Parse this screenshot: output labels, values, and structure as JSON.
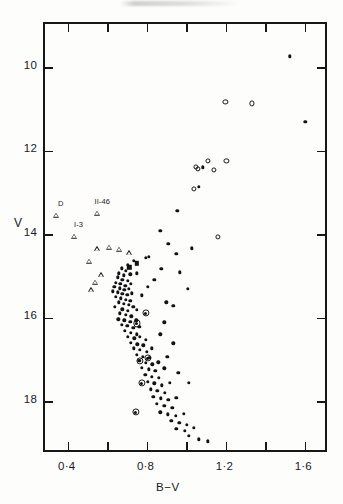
{
  "figure": {
    "type": "colour-magnitude-diagram",
    "has_title": false,
    "frame": {
      "x": 43,
      "y": 22,
      "width": 284,
      "height": 430
    }
  },
  "axes": {
    "x": {
      "label": "B−V",
      "tick_labels": [
        "0·4",
        "0·8",
        "1·2",
        "1·6"
      ],
      "tick_values": [
        0.4,
        0.8,
        1.2,
        1.6
      ],
      "minor_tick_values": [
        0.6,
        1.0,
        1.4
      ],
      "range": [
        0.28,
        1.72
      ]
    },
    "y": {
      "label": "V",
      "tick_labels": [
        "10",
        "12",
        "14",
        "16",
        "18"
      ],
      "tick_values": [
        10,
        12,
        14,
        16,
        18
      ],
      "range": [
        8.95,
        19.25
      ],
      "inverted": true
    }
  },
  "legend_symbols": [
    {
      "name": "filled-circle",
      "meaning": "photometric star"
    },
    {
      "name": "open-circle",
      "meaning": "giant"
    },
    {
      "name": "open-triangle",
      "meaning": "proper-motion member"
    },
    {
      "name": "circled-dot",
      "meaning": "variable / binary"
    },
    {
      "name": "filled-square",
      "meaning": "special star"
    }
  ],
  "annotations": [
    {
      "text": "D",
      "bv": 0.335,
      "v": 13.35
    },
    {
      "text": "II-46",
      "bv": 0.545,
      "v": 13.3
    },
    {
      "text": "I-3",
      "bv": 0.425,
      "v": 13.85
    }
  ],
  "chart_data": {
    "type": "scatter",
    "title": "",
    "xlabel": "B−V",
    "ylabel": "V",
    "xlim": [
      0.28,
      1.72
    ],
    "ylim": [
      19.25,
      8.95
    ],
    "grid": false,
    "legend_position": "none",
    "series": [
      {
        "name": "open-triangle",
        "marker": "triangle",
        "points": [
          [
            0.335,
            13.52
          ],
          [
            0.545,
            13.47
          ],
          [
            0.425,
            14.02
          ],
          [
            0.545,
            14.32
          ],
          [
            0.605,
            14.28
          ],
          [
            0.655,
            14.33
          ],
          [
            0.705,
            14.42
          ],
          [
            0.505,
            14.62
          ],
          [
            0.565,
            14.95
          ],
          [
            0.535,
            15.12
          ],
          [
            0.512,
            15.3
          ]
        ]
      },
      {
        "name": "open-circle",
        "marker": "open-circle",
        "points": [
          [
            1.195,
            10.82
          ],
          [
            1.33,
            10.85
          ],
          [
            1.105,
            12.22
          ],
          [
            1.2,
            12.22
          ],
          [
            1.135,
            12.45
          ],
          [
            1.045,
            12.38
          ],
          [
            1.055,
            12.42
          ],
          [
            1.035,
            12.9
          ],
          [
            1.155,
            14.05
          ]
        ]
      },
      {
        "name": "circled-dot",
        "marker": "circled-dot",
        "points": [
          [
            0.79,
            15.88
          ],
          [
            0.745,
            16.12
          ],
          [
            0.8,
            16.95
          ],
          [
            0.76,
            17.02
          ],
          [
            0.77,
            17.55
          ],
          [
            0.74,
            18.25
          ]
        ]
      },
      {
        "name": "filled-square",
        "marker": "square",
        "points": [
          [
            0.745,
            14.68
          ],
          [
            0.707,
            14.78
          ]
        ]
      },
      {
        "name": "filled-circle",
        "marker": "dot",
        "points": [
          [
            1.52,
            9.72
          ],
          [
            1.6,
            11.3
          ],
          [
            1.08,
            12.38
          ],
          [
            1.06,
            12.85
          ],
          [
            0.95,
            13.42
          ],
          [
            0.865,
            13.9
          ],
          [
            0.905,
            14.22
          ],
          [
            1.025,
            14.32
          ],
          [
            0.945,
            14.45
          ],
          [
            0.79,
            14.55
          ],
          [
            0.805,
            14.52
          ],
          [
            0.73,
            14.62
          ],
          [
            0.7,
            14.72
          ],
          [
            0.668,
            14.8
          ],
          [
            0.69,
            14.86
          ],
          [
            0.655,
            14.92
          ],
          [
            0.68,
            14.97
          ],
          [
            0.712,
            14.95
          ],
          [
            0.745,
            14.92
          ],
          [
            0.648,
            15.02
          ],
          [
            0.672,
            15.08
          ],
          [
            0.7,
            15.1
          ],
          [
            0.64,
            15.15
          ],
          [
            0.662,
            15.18
          ],
          [
            0.688,
            15.22
          ],
          [
            0.715,
            15.18
          ],
          [
            0.632,
            15.24
          ],
          [
            0.658,
            15.28
          ],
          [
            0.682,
            15.32
          ],
          [
            0.706,
            15.3
          ],
          [
            0.625,
            15.35
          ],
          [
            0.648,
            15.38
          ],
          [
            0.672,
            15.42
          ],
          [
            0.698,
            15.44
          ],
          [
            0.72,
            15.4
          ],
          [
            0.64,
            15.48
          ],
          [
            0.665,
            15.52
          ],
          [
            0.69,
            15.55
          ],
          [
            0.712,
            15.58
          ],
          [
            0.655,
            15.62
          ],
          [
            0.68,
            15.65
          ],
          [
            0.705,
            15.68
          ],
          [
            0.635,
            15.72
          ],
          [
            0.728,
            15.72
          ],
          [
            0.672,
            15.78
          ],
          [
            0.7,
            15.82
          ],
          [
            0.745,
            15.8
          ],
          [
            0.66,
            15.88
          ],
          [
            0.69,
            15.92
          ],
          [
            0.718,
            15.95
          ],
          [
            0.652,
            16.02
          ],
          [
            0.682,
            16.05
          ],
          [
            0.712,
            16.08
          ],
          [
            0.742,
            16.05
          ],
          [
            0.668,
            16.15
          ],
          [
            0.698,
            16.18
          ],
          [
            0.728,
            16.22
          ],
          [
            0.758,
            16.2
          ],
          [
            0.685,
            16.3
          ],
          [
            0.715,
            16.34
          ],
          [
            0.745,
            16.38
          ],
          [
            0.7,
            16.45
          ],
          [
            0.732,
            16.48
          ],
          [
            0.762,
            16.45
          ],
          [
            0.792,
            16.52
          ],
          [
            0.715,
            16.58
          ],
          [
            0.748,
            16.62
          ],
          [
            0.778,
            16.65
          ],
          [
            0.73,
            16.72
          ],
          [
            0.76,
            16.76
          ],
          [
            0.795,
            16.8
          ],
          [
            0.82,
            16.72
          ],
          [
            0.745,
            16.88
          ],
          [
            0.775,
            16.92
          ],
          [
            0.808,
            16.95
          ],
          [
            0.758,
            17.02
          ],
          [
            0.79,
            17.06
          ],
          [
            0.825,
            17.1
          ],
          [
            0.855,
            17.05
          ],
          [
            0.772,
            17.18
          ],
          [
            0.805,
            17.22
          ],
          [
            0.84,
            17.25
          ],
          [
            0.885,
            17.2
          ],
          [
            0.788,
            17.35
          ],
          [
            0.822,
            17.4
          ],
          [
            0.858,
            17.42
          ],
          [
            0.8,
            17.52
          ],
          [
            0.835,
            17.56
          ],
          [
            0.872,
            17.6
          ],
          [
            0.912,
            17.55
          ],
          [
            0.815,
            17.7
          ],
          [
            0.85,
            17.74
          ],
          [
            0.888,
            17.78
          ],
          [
            0.83,
            17.88
          ],
          [
            0.868,
            17.92
          ],
          [
            0.905,
            17.95
          ],
          [
            0.945,
            17.9
          ],
          [
            0.848,
            18.05
          ],
          [
            0.885,
            18.1
          ],
          [
            0.925,
            18.14
          ],
          [
            0.865,
            18.25
          ],
          [
            0.902,
            18.3
          ],
          [
            0.942,
            18.34
          ],
          [
            0.985,
            18.28
          ],
          [
            0.92,
            18.45
          ],
          [
            0.96,
            18.5
          ],
          [
            1.0,
            18.55
          ],
          [
            0.945,
            18.65
          ],
          [
            0.99,
            18.7
          ],
          [
            1.035,
            18.62
          ],
          [
            1.01,
            18.82
          ],
          [
            1.06,
            18.9
          ],
          [
            1.105,
            18.95
          ],
          [
            0.895,
            15.62
          ],
          [
            0.93,
            15.7
          ],
          [
            0.885,
            16.1
          ],
          [
            0.865,
            16.38
          ],
          [
            0.93,
            16.6
          ],
          [
            0.9,
            16.92
          ],
          [
            0.955,
            17.3
          ],
          [
            1.01,
            17.55
          ],
          [
            0.87,
            14.82
          ],
          [
            0.835,
            15.08
          ],
          [
            0.8,
            15.25
          ],
          [
            0.77,
            15.45
          ],
          [
            0.965,
            14.9
          ],
          [
            1.005,
            15.3
          ]
        ]
      }
    ]
  }
}
